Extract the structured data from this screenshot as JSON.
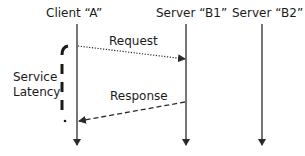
{
  "diagram": {
    "type": "sequence",
    "participants": [
      {
        "id": "client_a",
        "label": "Client “A”"
      },
      {
        "id": "server_b1",
        "label": "Server “B1”"
      },
      {
        "id": "server_b2",
        "label": "Server “B2”"
      }
    ],
    "messages": [
      {
        "label": "Request",
        "from": "client_a",
        "to": "server_b1",
        "style": "dotted"
      },
      {
        "label": "Response",
        "from": "server_b1",
        "to": "client_a",
        "style": "dashed"
      }
    ],
    "annotation": {
      "label_line1": "Service",
      "label_line2": "Latency"
    },
    "colors": {
      "line": "#2b2b2b",
      "text": "#1a1a1a",
      "background": "#ffffff"
    }
  }
}
